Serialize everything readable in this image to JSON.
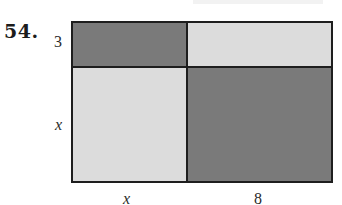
{
  "problem": {
    "number": "54."
  },
  "diagram": {
    "type": "area-model-rectangle",
    "side_labels": {
      "left_top": "3",
      "left_bottom": "x",
      "bottom_left": "x",
      "bottom_right": "8"
    },
    "regions": [
      {
        "position": "top-left",
        "dimensions": "x by 3",
        "shade": "dark"
      },
      {
        "position": "top-right",
        "dimensions": "8 by 3",
        "shade": "light"
      },
      {
        "position": "bottom-left",
        "dimensions": "x by x",
        "shade": "light"
      },
      {
        "position": "bottom-right",
        "dimensions": "8 by x",
        "shade": "dark"
      }
    ],
    "colors": {
      "dark": "#7a7a7a",
      "light": "#dcdcdc",
      "border": "#1e1e1e"
    }
  }
}
